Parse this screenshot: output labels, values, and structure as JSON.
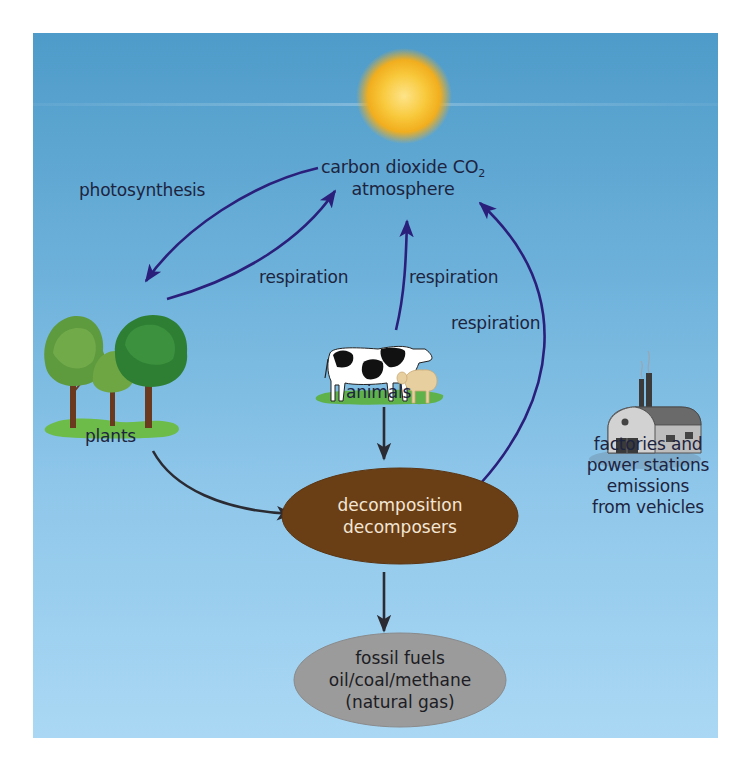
{
  "diagram": {
    "atmosphere": {
      "line1": "carbon dioxide CO",
      "subscript": "2",
      "line2": "atmosphere"
    },
    "labels": {
      "photosynthesis": "photosynthesis",
      "respiration_plants": "respiration",
      "respiration_animals": "respiration",
      "respiration_decomposers": "respiration",
      "plants": "plants",
      "animals": "animals"
    },
    "factories": {
      "line1": "factories and",
      "line2": "power stations",
      "line3": "emissions",
      "line4": "from vehicles"
    },
    "decomposition": {
      "line1": "decomposition",
      "line2": "decomposers"
    },
    "fossil_fuels": {
      "line1": "fossil fuels",
      "line2": "oil/coal/methane",
      "line3": "(natural gas)"
    },
    "icons": [
      "sun-icon",
      "trees-icon",
      "cow-icon",
      "sheep-icon",
      "factory-icon"
    ],
    "colors": {
      "sky_top": "#4e9bc9",
      "sky_bottom": "#aad8f4",
      "arrow_blue": "#2a1f7a",
      "arrow_dark": "#2b2b33",
      "decomposition_fill": "#6b3f16",
      "fossil_fill": "#9a9a9a",
      "sun": "#f7c431",
      "text": "#1d2440"
    }
  }
}
